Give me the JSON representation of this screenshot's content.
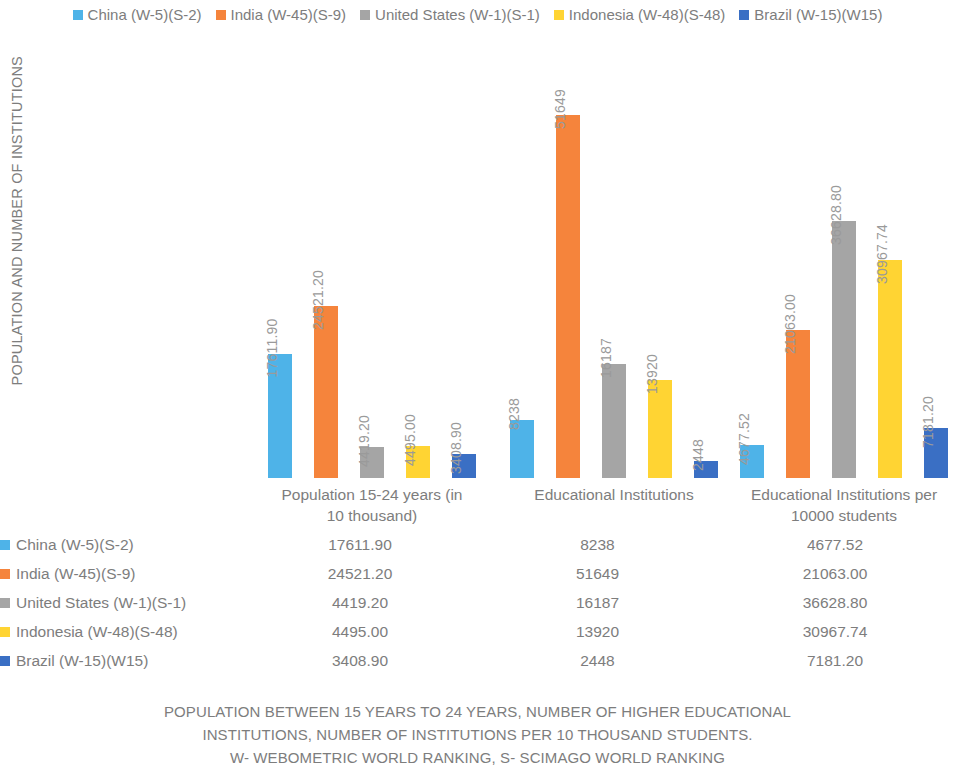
{
  "legend": {
    "position": "top-center",
    "items": [
      {
        "label": "China (W-5)(S-2)",
        "color": "#4EB3E8"
      },
      {
        "label": "India (W-45)(S-9)",
        "color": "#F5843C"
      },
      {
        "label": "United States (W-1)(S-1)",
        "color": "#A5A5A5"
      },
      {
        "label": "Indonesia (W-48)(S-48)",
        "color": "#FFD433"
      },
      {
        "label": "Brazil (W-15)(W15)",
        "color": "#3A6FC4"
      }
    ]
  },
  "axes": {
    "y_title": "POPULATION AND NUMBER OF INSTITUTIONS"
  },
  "categories_display": [
    [
      "Population 15-24 years (in",
      "10 thousand)"
    ],
    [
      "Educational Institutions"
    ],
    [
      "Educational Institutions per",
      "10000 students"
    ]
  ],
  "table": {
    "rows": [
      {
        "label": "China (W-5)(S-2)",
        "color": "#4EB3E8",
        "v1": "17611.90",
        "v2": "8238",
        "v3": "4677.52"
      },
      {
        "label": "India (W-45)(S-9)",
        "color": "#F5843C",
        "v1": "24521.20",
        "v2": "51649",
        "v3": "21063.00"
      },
      {
        "label": "United States (W-1)(S-1)",
        "color": "#A5A5A5",
        "v1": "4419.20",
        "v2": "16187",
        "v3": "36628.80"
      },
      {
        "label": "Indonesia (W-48)(S-48)",
        "color": "#FFD433",
        "v1": "4495.00",
        "v2": "13920",
        "v3": "30967.74"
      },
      {
        "label": "Brazil (W-15)(W15)",
        "color": "#3A6FC4",
        "v1": "3408.90",
        "v2": "2448",
        "v3": "7181.20"
      }
    ]
  },
  "caption": {
    "line1": "POPULATION BETWEEN 15 YEARS TO 24 YEARS, NUMBER OF HIGHER EDUCATIONAL",
    "line2": "INSTITUTIONS, NUMBER OF INSTITUTIONS PER 10 THOUSAND STUDENTS.",
    "line3": "W- WEBOMETRIC WORLD RANKING, S- SCIMAGO WORLD RANKING"
  },
  "chart_data": {
    "type": "bar",
    "title": "",
    "xlabel": "",
    "ylabel": "POPULATION AND NUMBER OF INSTITUTIONS",
    "grid": false,
    "legend_position": "top-center",
    "ylim": [
      0,
      51649
    ],
    "y_ticks_shown": false,
    "data_labels_shown": true,
    "categories": [
      "Population 15-24 years (in 10 thousand)",
      "Educational Institutions",
      "Educational Institutions per 10000 students"
    ],
    "series": [
      {
        "name": "China (W-5)(S-2)",
        "color": "#4EB3E8",
        "values": [
          17611.9,
          8238,
          4677.52
        ],
        "labels": [
          "17611.90",
          "8238",
          "4677.52"
        ]
      },
      {
        "name": "India (W-45)(S-9)",
        "color": "#F5843C",
        "values": [
          24521.2,
          51649,
          21063.0
        ],
        "labels": [
          "24521.20",
          "51649",
          "21063.00"
        ]
      },
      {
        "name": "United States (W-1)(S-1)",
        "color": "#A5A5A5",
        "values": [
          4419.2,
          16187,
          36628.8
        ],
        "labels": [
          "4419.20",
          "16187",
          "36628.80"
        ]
      },
      {
        "name": "Indonesia (W-48)(S-48)",
        "color": "#FFD433",
        "values": [
          4495.0,
          13920,
          30967.74
        ],
        "labels": [
          "4495.00",
          "13920",
          "30967.74"
        ]
      },
      {
        "name": "Brazil (W-15)(W15)",
        "color": "#3A6FC4",
        "values": [
          3408.9,
          2448,
          7181.2
        ],
        "labels": [
          "3408.90",
          "2448",
          "7181.20"
        ]
      }
    ]
  }
}
